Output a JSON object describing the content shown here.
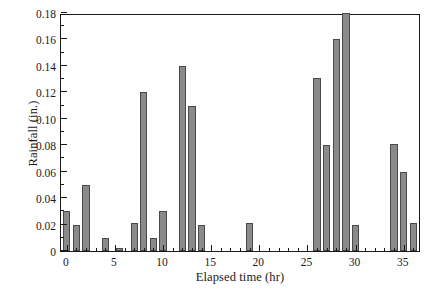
{
  "chart_data": {
    "type": "bar",
    "title": "",
    "xlabel": "Elapsed time (hr)",
    "ylabel": "Rainfall (in.)",
    "xlim": [
      -0.6,
      36.8
    ],
    "ylim": [
      0,
      0.18
    ],
    "grid": false,
    "legend": null,
    "bar_width_hr": 0.75,
    "bar_fill_color": "#8a8a8a",
    "bar_edge_color": "#4a4a4a",
    "axis_color": "#1a1a1a",
    "background_color": "#ffffff",
    "xticks": [
      0,
      5,
      10,
      15,
      20,
      25,
      30,
      35
    ],
    "xtick_labels": [
      "0",
      "5",
      "10",
      "15",
      "20",
      "25",
      "30",
      "35"
    ],
    "xtick_minor_step": 1,
    "yticks": [
      0,
      0.02,
      0.04,
      0.06,
      0.08,
      0.1,
      0.12,
      0.14,
      0.16,
      0.18
    ],
    "ytick_labels": [
      "0",
      "0.02",
      "0.04",
      "0.06",
      "0.08",
      "0.10",
      "0.12",
      "0.14",
      "0.16",
      "0.18"
    ],
    "ytick_minor_step": 0.01,
    "x": [
      0,
      1,
      2,
      4,
      5.5,
      7,
      8,
      9,
      10,
      12,
      13,
      14,
      19,
      26,
      27,
      28,
      29,
      30,
      34,
      35,
      36
    ],
    "values": [
      0.03,
      0.02,
      0.05,
      0.01,
      0.002,
      0.021,
      0.12,
      0.01,
      0.03,
      0.14,
      0.11,
      0.02,
      0.021,
      0.131,
      0.08,
      0.16,
      0.18,
      0.02,
      0.081,
      0.06,
      0.021
    ]
  }
}
